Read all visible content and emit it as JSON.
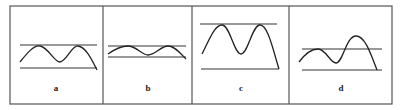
{
  "panels": [
    {
      "label": "a",
      "description": "Curve with two equal peaks touching upper line; ends below lower line",
      "upper_line": {
        "x1": 20,
        "x2": 97,
        "y": 45
      },
      "lower_line": {
        "x1": 20,
        "x2": 97,
        "y": 68
      },
      "curve": "M20,62 C28,52 34,45 40,46 C48,47 54,62 60,62 C66,62 72,45 78,46 C86,47 92,60 97,70"
    },
    {
      "label": "b",
      "description": "Low-amplitude wave between two close lines",
      "upper_line": {
        "x1": 108,
        "x2": 186,
        "y": 46
      },
      "lower_line": {
        "x1": 108,
        "x2": 186,
        "y": 57
      },
      "curve": "M108,54 C115,49 122,46 128,46 C136,46 142,55 148,55 C155,55 161,46 168,46 C175,46 181,54 186,59"
    },
    {
      "label": "c",
      "description": "Large-amplitude wave with two tall peaks touching upper line",
      "upper_line": {
        "x1": 200,
        "x2": 277,
        "y": 24
      },
      "lower_line": {
        "x1": 201,
        "x2": 279,
        "y": 69
      },
      "curve": "M202,54 C210,38 215,25 222,25 C230,25 234,54 241,54 C248,54 252,25 260,25 C268,25 273,50 279,69"
    },
    {
      "label": "d",
      "description": "Wave with second peak higher, crossing the upper line",
      "upper_line": {
        "x1": 302,
        "x2": 382,
        "y": 49
      },
      "lower_line": {
        "x1": 302,
        "x2": 382,
        "y": 70
      },
      "curve": "M299,62 C305,54 311,49 318,49 C326,49 330,63 336,63 C343,63 346,36 356,36 C366,36 372,58 377,70"
    }
  ],
  "frame": {
    "x": 10,
    "y": 6,
    "width": 382,
    "height": 98
  },
  "dividers": [
    103,
    192,
    289
  ],
  "label_y": 91
}
